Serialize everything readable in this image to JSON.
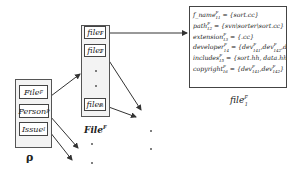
{
  "diagram": {
    "rho": {
      "caption": "ρ",
      "items": [
        {
          "name": "File",
          "sup": "F"
        },
        {
          "name": "Person",
          "sup": "P"
        },
        {
          "name": "Issue",
          "sup": "I"
        }
      ]
    },
    "file_set": {
      "caption": "File",
      "caption_sup": "F",
      "items": [
        {
          "name": "file",
          "sup": "F",
          "sub": "1"
        },
        {
          "name": "file",
          "sup": "F",
          "sub": "2"
        },
        {
          "name": "file",
          "sup": "F",
          "sub": "m"
        }
      ]
    },
    "file1_attributes": {
      "caption": "file",
      "caption_sup": "F",
      "caption_sub": "1",
      "rows": [
        {
          "name": "f_name",
          "sup": "F",
          "sub": "11",
          "value": " = {sort.cc}"
        },
        {
          "name": "path",
          "sup": "F",
          "sub": "12",
          "value": " = {svn\\sorter\\sort.cc}"
        },
        {
          "name": "extension",
          "sup": "F",
          "sub": "13",
          "value": " = {.cc}"
        },
        {
          "name": "developer",
          "sup": "F",
          "sub": "14",
          "value": " = {dev",
          "parts": [
            {
              "sup": "F",
              "sub": "141"
            },
            {
              "sup": "F",
              "sub": "142"
            },
            {
              "sup": "F",
              "sub": "143"
            }
          ]
        },
        {
          "name": "includes",
          "sup": "F",
          "sub": "15",
          "value": " = {sort.hh, data.hh}"
        },
        {
          "name": "copyright",
          "sup": "F",
          "sub": "16",
          "value": " = {dev",
          "parts": [
            {
              "sup": "F",
              "sub": "141"
            },
            {
              "sup": "F",
              "sub": "142"
            }
          ]
        }
      ]
    }
  }
}
